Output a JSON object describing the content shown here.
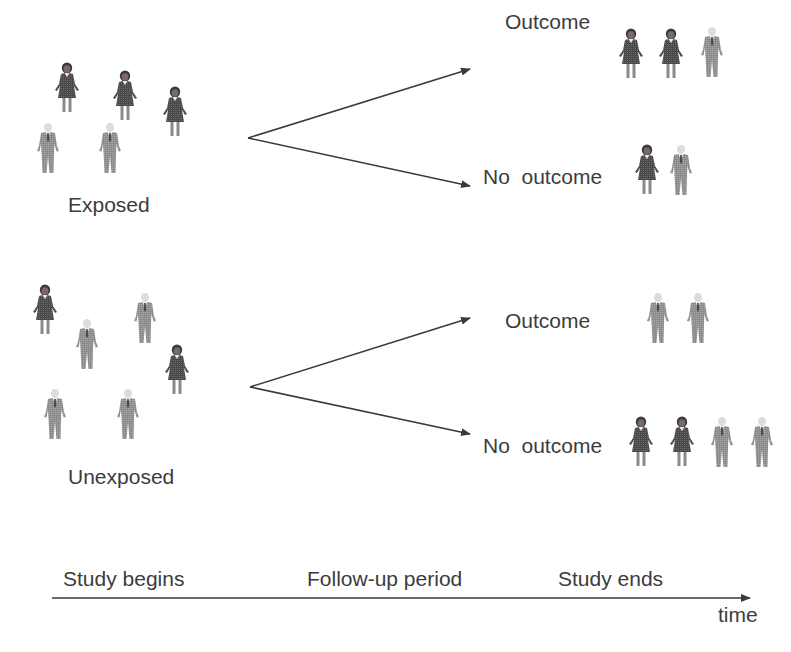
{
  "diagram": {
    "title": "",
    "groups": [
      {
        "id": "exposed",
        "label": "Exposed",
        "members": [
          "woman",
          "woman",
          "woman",
          "man",
          "man"
        ],
        "outcomes": [
          {
            "label": "Outcome",
            "members": [
              "woman",
              "woman",
              "man"
            ]
          },
          {
            "label": "No  outcome",
            "members": [
              "woman",
              "man"
            ]
          }
        ]
      },
      {
        "id": "unexposed",
        "label": "Unexposed",
        "members": [
          "woman",
          "man",
          "man",
          "woman",
          "man",
          "man"
        ],
        "outcomes": [
          {
            "label": "Outcome",
            "members": [
              "man",
              "man"
            ]
          },
          {
            "label": "No  outcome",
            "members": [
              "woman",
              "woman",
              "man",
              "man"
            ]
          }
        ]
      }
    ],
    "timeline": {
      "start_label": "Study begins",
      "middle_label": "Follow-up period",
      "end_label": "Study ends",
      "axis_label": "time"
    },
    "icons": {
      "woman": "woman-figure-icon",
      "man": "man-figure-icon",
      "arrow": "arrow-right-icon"
    },
    "colors": {
      "background": "#ffffff",
      "text": "#3c3c3c",
      "arrow": "#3a3a3a",
      "woman_fill": "#4a4a4a",
      "woman_hair": "#3a3a3a",
      "man_fill": "#8a8a8a",
      "man_head": "#d8d8d8"
    }
  }
}
